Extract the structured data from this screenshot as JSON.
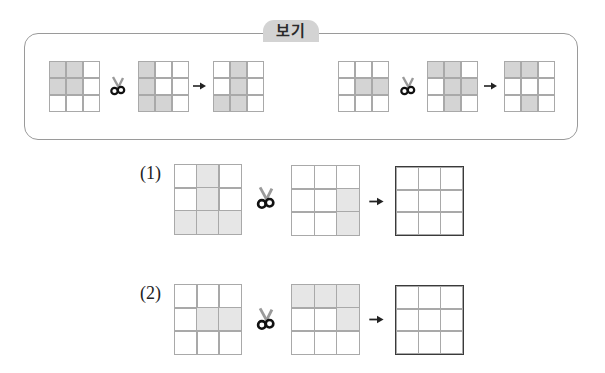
{
  "example": {
    "tab_label": "보기",
    "pairs": [
      {
        "left": [
          [
            1,
            1,
            0
          ],
          [
            1,
            1,
            0
          ],
          [
            0,
            0,
            0
          ]
        ],
        "right": [
          [
            1,
            0,
            0
          ],
          [
            1,
            0,
            0
          ],
          [
            1,
            1,
            0
          ]
        ],
        "result": [
          [
            0,
            1,
            0
          ],
          [
            0,
            1,
            0
          ],
          [
            1,
            1,
            0
          ]
        ]
      },
      {
        "left": [
          [
            0,
            0,
            0
          ],
          [
            0,
            1,
            1
          ],
          [
            0,
            0,
            0
          ]
        ],
        "right": [
          [
            1,
            1,
            0
          ],
          [
            0,
            1,
            1
          ],
          [
            0,
            1,
            0
          ]
        ],
        "result": [
          [
            1,
            1,
            0
          ],
          [
            0,
            0,
            0
          ],
          [
            0,
            1,
            0
          ]
        ]
      }
    ]
  },
  "problems": [
    {
      "label": "(1)",
      "left": [
        [
          0,
          1,
          0
        ],
        [
          0,
          1,
          0
        ],
        [
          1,
          1,
          1
        ]
      ],
      "right": [
        [
          0,
          0,
          0
        ],
        [
          0,
          0,
          1
        ],
        [
          0,
          0,
          1
        ]
      ],
      "answer": [
        [
          0,
          0,
          0
        ],
        [
          0,
          0,
          0
        ],
        [
          0,
          0,
          0
        ]
      ]
    },
    {
      "label": "(2)",
      "left": [
        [
          0,
          0,
          0
        ],
        [
          0,
          1,
          1
        ],
        [
          0,
          0,
          0
        ]
      ],
      "right": [
        [
          1,
          1,
          1
        ],
        [
          0,
          0,
          1
        ],
        [
          0,
          0,
          0
        ]
      ],
      "answer": [
        [
          0,
          0,
          0
        ],
        [
          0,
          0,
          0
        ],
        [
          0,
          0,
          0
        ]
      ]
    }
  ],
  "icons": {
    "operator": "scissors-icon",
    "result": "arrow-right-icon"
  },
  "colors": {
    "example_fill": "#d4d4d4",
    "problem_fill": "#e6e6e6",
    "grid_line": "#a9a9a9",
    "answer_border": "#3a3a3a",
    "tab_bg": "#d3d3d3"
  }
}
